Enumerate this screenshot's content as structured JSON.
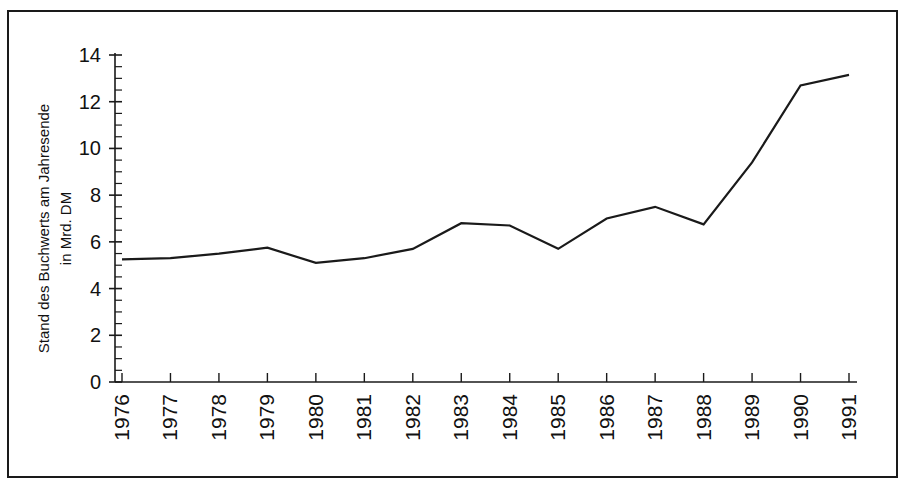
{
  "chart_data": {
    "type": "line",
    "title": "",
    "subtitle": "",
    "xlabel": "",
    "ylabel": "Stand des Buchwerts am Jahresende in Mrd. DM",
    "ylabel_lines": [
      "Stand des Buchwerts am Jahresende",
      "in Mrd. DM"
    ],
    "categories": [
      "1976",
      "1977",
      "1978",
      "1979",
      "1980",
      "1981",
      "1982",
      "1983",
      "1984",
      "1985",
      "1986",
      "1987",
      "1988",
      "1989",
      "1990",
      "1991"
    ],
    "values": [
      5.25,
      5.3,
      5.5,
      5.75,
      5.1,
      5.3,
      5.7,
      6.8,
      6.7,
      5.7,
      7.0,
      7.5,
      6.75,
      9.4,
      12.7,
      13.15
    ],
    "series": [
      {
        "name": "Stand des Buchwerts am Jahresende in Mrd. DM",
        "values": [
          5.25,
          5.3,
          5.5,
          5.75,
          5.1,
          5.3,
          5.7,
          6.8,
          6.7,
          5.7,
          7.0,
          7.5,
          6.75,
          9.4,
          12.7,
          13.15
        ]
      }
    ],
    "ylim": [
      0,
      14
    ],
    "ytick_labels": [
      "0",
      "2",
      "4",
      "6",
      "8",
      "10",
      "12",
      "14"
    ],
    "ytick_values": [
      0,
      2,
      4,
      6,
      8,
      10,
      12,
      14
    ],
    "yminor_step": 0.5,
    "xtick_labels": [
      "1976",
      "1977",
      "1978",
      "1979",
      "1980",
      "1981",
      "1982",
      "1983",
      "1984",
      "1985",
      "1986",
      "1987",
      "1988",
      "1989",
      "1990",
      "1991"
    ],
    "xtick_rotation": 90,
    "grid": false,
    "legend": false,
    "legend_position": "none",
    "line_color": "#1a1a1a",
    "axis_color": "#1a1a1a",
    "frame_color": "#1a1a1a",
    "background_color": "#ffffff",
    "annotations": []
  }
}
